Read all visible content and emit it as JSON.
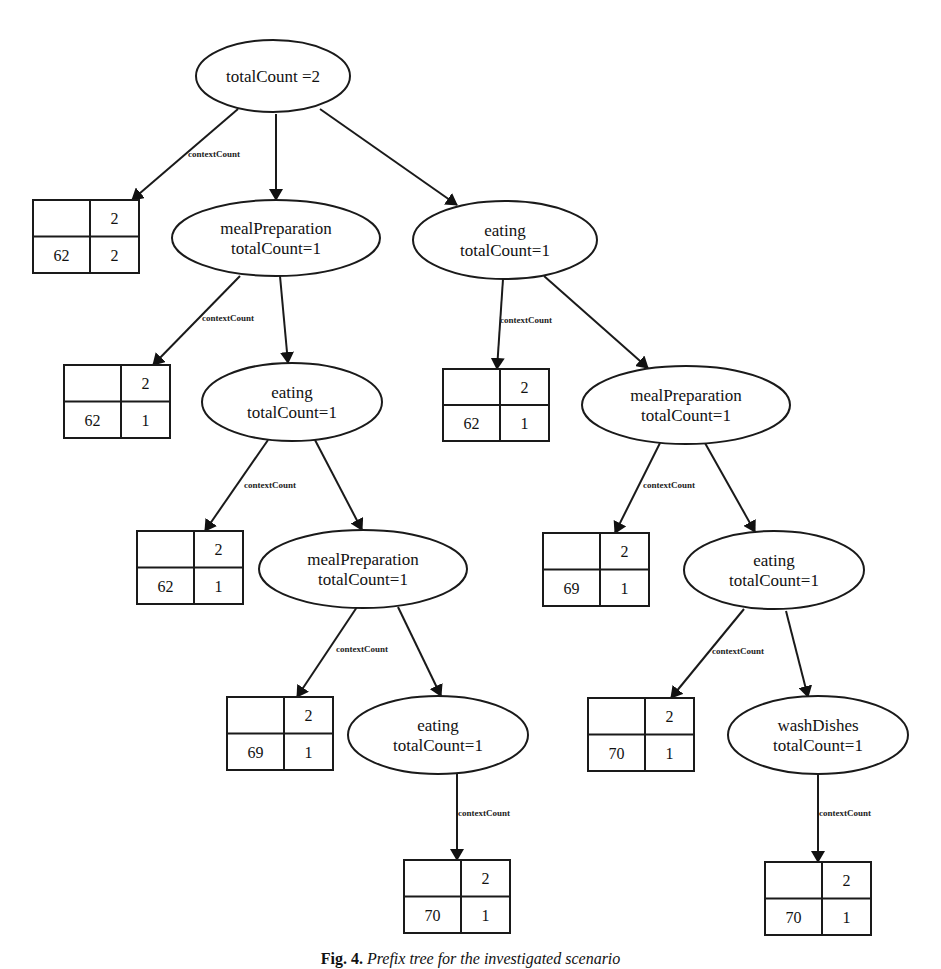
{
  "figure": {
    "caption_label": "Fig. 4.",
    "caption_text": "Prefix tree for the investigated scenario"
  },
  "edge_label": "contextCount",
  "nodes": [
    {
      "id": "root",
      "lines": [
        "totalCount =2"
      ],
      "cx": 273,
      "cy": 76,
      "rx": 77,
      "ry": 36
    },
    {
      "id": "mp1",
      "lines": [
        "mealPreparation",
        "totalCount=1"
      ],
      "cx": 276,
      "cy": 238,
      "rx": 104,
      "ry": 38
    },
    {
      "id": "eat1",
      "lines": [
        "eating",
        "totalCount=1"
      ],
      "cx": 505,
      "cy": 240,
      "rx": 92,
      "ry": 39
    },
    {
      "id": "eat2",
      "lines": [
        "eating",
        "totalCount=1"
      ],
      "cx": 292,
      "cy": 402,
      "rx": 90,
      "ry": 39
    },
    {
      "id": "mp2",
      "lines": [
        "mealPreparation",
        "totalCount=1"
      ],
      "cx": 686,
      "cy": 405,
      "rx": 104,
      "ry": 39
    },
    {
      "id": "mp3",
      "lines": [
        "mealPreparation",
        "totalCount=1"
      ],
      "cx": 363,
      "cy": 569,
      "rx": 104,
      "ry": 39
    },
    {
      "id": "eat3",
      "lines": [
        "eating",
        "totalCount=1"
      ],
      "cx": 774,
      "cy": 570,
      "rx": 90,
      "ry": 39
    },
    {
      "id": "eat4",
      "lines": [
        "eating",
        "totalCount=1"
      ],
      "cx": 438,
      "cy": 735,
      "rx": 90,
      "ry": 39
    },
    {
      "id": "wd",
      "lines": [
        "washDishes",
        "totalCount=1"
      ],
      "cx": 818,
      "cy": 735,
      "rx": 90,
      "ry": 39
    }
  ],
  "tables": [
    {
      "id": "t_root",
      "x": 33,
      "y": 200,
      "w": 106,
      "h": 73,
      "header": [
        "",
        "2"
      ],
      "row": [
        "62",
        "2"
      ]
    },
    {
      "id": "t_mp1",
      "x": 64,
      "y": 365,
      "w": 106,
      "h": 73,
      "header": [
        "",
        "2"
      ],
      "row": [
        "62",
        "1"
      ]
    },
    {
      "id": "t_eat1",
      "x": 443,
      "y": 369,
      "w": 106,
      "h": 72,
      "header": [
        "",
        "2"
      ],
      "row": [
        "62",
        "1"
      ]
    },
    {
      "id": "t_eat2",
      "x": 137,
      "y": 531,
      "w": 106,
      "h": 73,
      "header": [
        "",
        "2"
      ],
      "row": [
        "62",
        "1"
      ]
    },
    {
      "id": "t_mp2",
      "x": 543,
      "y": 533,
      "w": 106,
      "h": 73,
      "header": [
        "",
        "2"
      ],
      "row": [
        "69",
        "1"
      ]
    },
    {
      "id": "t_mp3",
      "x": 227,
      "y": 697,
      "w": 106,
      "h": 73,
      "header": [
        "",
        "2"
      ],
      "row": [
        "69",
        "1"
      ]
    },
    {
      "id": "t_eat3",
      "x": 588,
      "y": 698,
      "w": 106,
      "h": 73,
      "header": [
        "",
        "2"
      ],
      "row": [
        "70",
        "1"
      ]
    },
    {
      "id": "t_eat4",
      "x": 404,
      "y": 860,
      "w": 106,
      "h": 73,
      "header": [
        "",
        "2"
      ],
      "row": [
        "70",
        "1"
      ]
    },
    {
      "id": "t_wd",
      "x": 765,
      "y": 862,
      "w": 106,
      "h": 73,
      "header": [
        "",
        "2"
      ],
      "row": [
        "70",
        "1"
      ]
    }
  ],
  "edges": [
    {
      "from": "root",
      "to": "t_root",
      "x1": 238,
      "y1": 109,
      "x2": 132,
      "y2": 200,
      "labelled": true,
      "lx": 188,
      "ly": 157
    },
    {
      "from": "root",
      "to": "mp1",
      "x1": 276,
      "y1": 114,
      "x2": 276,
      "y2": 200,
      "labelled": false
    },
    {
      "from": "root",
      "to": "eat1",
      "x1": 320,
      "y1": 109,
      "x2": 457,
      "y2": 205,
      "labelled": false
    },
    {
      "from": "mp1",
      "to": "t_mp1",
      "x1": 240,
      "y1": 276,
      "x2": 153,
      "y2": 365,
      "labelled": true,
      "lx": 202,
      "ly": 321
    },
    {
      "from": "mp1",
      "to": "eat2",
      "x1": 280,
      "y1": 276,
      "x2": 288,
      "y2": 363,
      "labelled": false
    },
    {
      "from": "eat1",
      "to": "t_eat1",
      "x1": 503,
      "y1": 279,
      "x2": 497,
      "y2": 369,
      "labelled": true,
      "lx": 500,
      "ly": 323
    },
    {
      "from": "eat1",
      "to": "mp2",
      "x1": 544,
      "y1": 276,
      "x2": 648,
      "y2": 368,
      "labelled": false
    },
    {
      "from": "eat2",
      "to": "t_eat2",
      "x1": 268,
      "y1": 440,
      "x2": 205,
      "y2": 531,
      "labelled": true,
      "lx": 244,
      "ly": 488
    },
    {
      "from": "eat2",
      "to": "mp3",
      "x1": 315,
      "y1": 440,
      "x2": 362,
      "y2": 530,
      "labelled": false
    },
    {
      "from": "mp2",
      "to": "t_mp2",
      "x1": 660,
      "y1": 443,
      "x2": 615,
      "y2": 533,
      "labelled": true,
      "lx": 643,
      "ly": 488
    },
    {
      "from": "mp2",
      "to": "eat3",
      "x1": 705,
      "y1": 443,
      "x2": 755,
      "y2": 532,
      "labelled": false
    },
    {
      "from": "mp3",
      "to": "t_mp3",
      "x1": 357,
      "y1": 607,
      "x2": 297,
      "y2": 697,
      "labelled": true,
      "lx": 336,
      "ly": 652
    },
    {
      "from": "mp3",
      "to": "eat4",
      "x1": 398,
      "y1": 607,
      "x2": 441,
      "y2": 696,
      "labelled": false
    },
    {
      "from": "eat3",
      "to": "t_eat3",
      "x1": 744,
      "y1": 609,
      "x2": 671,
      "y2": 698,
      "labelled": true,
      "lx": 712,
      "ly": 654
    },
    {
      "from": "eat3",
      "to": "wd",
      "x1": 786,
      "y1": 611,
      "x2": 808,
      "y2": 697,
      "labelled": false
    },
    {
      "from": "eat4",
      "to": "t_eat4",
      "x1": 457,
      "y1": 774,
      "x2": 457,
      "y2": 860,
      "labelled": true,
      "lx": 458,
      "ly": 816
    },
    {
      "from": "wd",
      "to": "t_wd",
      "x1": 818,
      "y1": 774,
      "x2": 818,
      "y2": 862,
      "labelled": true,
      "lx": 819,
      "ly": 816
    }
  ]
}
